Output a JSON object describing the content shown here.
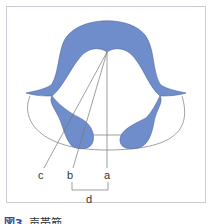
{
  "figure": {
    "caption_prefix": "図3",
    "caption_text": "声帯筋",
    "colors": {
      "muscle_fill": "#6f8ccb",
      "muscle_stroke": "#4c66a6",
      "outline": "#777777",
      "frame_border": "#c9ced6"
    }
  },
  "labels": {
    "a": "a",
    "b": "b",
    "c": "c",
    "d": "d"
  }
}
